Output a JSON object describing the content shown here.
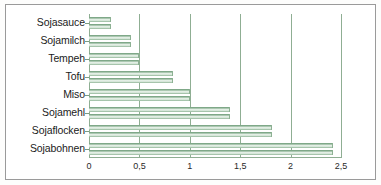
{
  "chart_data": {
    "type": "bar",
    "orientation": "horizontal",
    "title": "",
    "subtitle": "",
    "xlabel": "",
    "ylabel": "",
    "categories": [
      "Sojabohnen",
      "Sojaflocken",
      "Sojamehl",
      "Miso",
      "Tofu",
      "Tempeh",
      "Sojamilch",
      "Sojasauce"
    ],
    "values": [
      2.42,
      1.82,
      1.4,
      1.0,
      0.83,
      0.5,
      0.42,
      0.22
    ],
    "xlim": [
      0,
      2.5
    ],
    "ylim": [
      0,
      8
    ],
    "xticks": [
      0,
      0.5,
      1,
      1.5,
      2,
      2.5
    ],
    "xticklabels": [
      "0",
      "0,5",
      "1",
      "1,5",
      "2",
      "2,5"
    ],
    "grid": "vertical",
    "legend": "none",
    "bar_color": "#8fae93",
    "axis_color": "#8fae93",
    "frame_color": "#9a9a9a",
    "background_color": "#ffffff"
  },
  "axis": {
    "ticks": [
      {
        "value": 0,
        "label": "0"
      },
      {
        "value": 0.5,
        "label": "0,5"
      },
      {
        "value": 1,
        "label": "1"
      },
      {
        "value": 1.5,
        "label": "1,5"
      },
      {
        "value": 2,
        "label": "2"
      },
      {
        "value": 2.5,
        "label": "2,5"
      }
    ]
  },
  "bars": [
    {
      "label": "Sojasauce",
      "value": 0.22
    },
    {
      "label": "Sojamilch",
      "value": 0.42
    },
    {
      "label": "Tempeh",
      "value": 0.5
    },
    {
      "label": "Tofu",
      "value": 0.83
    },
    {
      "label": "Miso",
      "value": 1.0
    },
    {
      "label": "Sojamehl",
      "value": 1.4
    },
    {
      "label": "Sojaflocken",
      "value": 1.82
    },
    {
      "label": "Sojabohnen",
      "value": 2.42
    }
  ]
}
